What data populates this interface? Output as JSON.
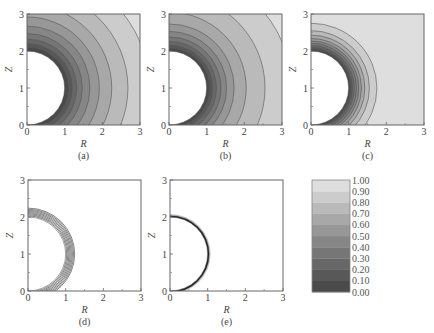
{
  "chart_data": [
    {
      "id": "a",
      "type": "heatmap",
      "subtype": "filled-contour",
      "caption": "(a)",
      "xlabel": "R",
      "ylabel": "Z",
      "xlim": [
        0,
        3
      ],
      "ylim": [
        0,
        3
      ],
      "xticks": [
        "0",
        "1",
        "2",
        "3"
      ],
      "yticks": [
        "0",
        "1",
        "2",
        "3"
      ],
      "obstacle": {
        "shape": "half-circle",
        "center": [
          0,
          1
        ],
        "radius": 1
      },
      "contour_radii": [
        1.1,
        1.2,
        1.32,
        1.47,
        1.67,
        1.92,
        2.25,
        2.68,
        3.25
      ],
      "contour_levels": [
        0.1,
        0.2,
        0.3,
        0.4,
        0.5,
        0.6,
        0.7,
        0.8,
        0.9
      ],
      "style": "filled"
    },
    {
      "id": "b",
      "type": "heatmap",
      "subtype": "filled-contour",
      "caption": "(b)",
      "xlabel": "R",
      "ylabel": "Z",
      "xlim": [
        0,
        3
      ],
      "ylim": [
        0,
        3
      ],
      "xticks": [
        "0",
        "1",
        "2",
        "3"
      ],
      "yticks": [
        "0",
        "1",
        "2",
        "3"
      ],
      "obstacle": {
        "shape": "half-circle",
        "center": [
          0,
          1
        ],
        "radius": 1
      },
      "contour_radii": [
        1.08,
        1.16,
        1.26,
        1.38,
        1.53,
        1.73,
        2.05,
        2.55,
        3.25
      ],
      "contour_levels": [
        0.1,
        0.2,
        0.3,
        0.4,
        0.5,
        0.6,
        0.7,
        0.8,
        0.9
      ],
      "style": "filled"
    },
    {
      "id": "c",
      "type": "heatmap",
      "subtype": "filled-contour",
      "caption": "(c)",
      "xlabel": "R",
      "ylabel": "Z",
      "xlim": [
        0,
        3
      ],
      "ylim": [
        0,
        3
      ],
      "xticks": [
        "0",
        "1",
        "2",
        "3"
      ],
      "yticks": [
        "0",
        "1",
        "2",
        "3"
      ],
      "obstacle": {
        "shape": "half-circle",
        "center": [
          0,
          1
        ],
        "radius": 1
      },
      "contour_radii": [
        1.05,
        1.1,
        1.15,
        1.21,
        1.27,
        1.34,
        1.43,
        1.55,
        1.75
      ],
      "contour_levels": [
        0.1,
        0.2,
        0.3,
        0.4,
        0.5,
        0.6,
        0.7,
        0.8,
        0.9
      ],
      "style": "filled"
    },
    {
      "id": "d",
      "type": "heatmap",
      "subtype": "line-contour",
      "caption": "(d)",
      "xlabel": "R",
      "ylabel": "Z",
      "xlim": [
        0,
        3
      ],
      "ylim": [
        0,
        3
      ],
      "xticks": [
        "0",
        "1",
        "2",
        "3"
      ],
      "yticks": [
        "0",
        "1",
        "2",
        "3"
      ],
      "obstacle": {
        "shape": "half-circle",
        "center": [
          0,
          1
        ],
        "radius": 1
      },
      "contour_radii": [
        1.03,
        1.06,
        1.09,
        1.12,
        1.15,
        1.18,
        1.21,
        1.24
      ],
      "contour_levels": [
        0.1,
        0.2,
        0.3,
        0.4,
        0.5,
        0.6,
        0.7,
        0.8
      ],
      "style": "lines"
    },
    {
      "id": "e",
      "type": "heatmap",
      "subtype": "line-contour",
      "caption": "(e)",
      "xlabel": "R",
      "ylabel": "Z",
      "xlim": [
        0,
        3
      ],
      "ylim": [
        0,
        3
      ],
      "xticks": [
        "0",
        "1",
        "2",
        "3"
      ],
      "yticks": [
        "0",
        "1",
        "2",
        "3"
      ],
      "obstacle": {
        "shape": "half-circle",
        "center": [
          0,
          1
        ],
        "radius": 1
      },
      "contour_radii": [
        1.01,
        1.02,
        1.03,
        1.04,
        1.05,
        1.06,
        1.08
      ],
      "contour_levels": [
        0.1,
        0.2,
        0.3,
        0.4,
        0.5,
        0.6,
        0.7
      ],
      "style": "thin-shell"
    }
  ],
  "colorbar": {
    "ticks": [
      "1.00",
      "0.90",
      "0.80",
      "0.70",
      "0.60",
      "0.50",
      "0.40",
      "0.30",
      "0.20",
      "0.10",
      "0.00"
    ],
    "min": 0.0,
    "max": 1.0,
    "colormap": "grayscale",
    "colors": [
      "#4a4a4a",
      "#585858",
      "#676767",
      "#767676",
      "#868686",
      "#979797",
      "#a8a8a8",
      "#bababa",
      "#cccccc",
      "#dedede",
      "#ffffff"
    ]
  }
}
